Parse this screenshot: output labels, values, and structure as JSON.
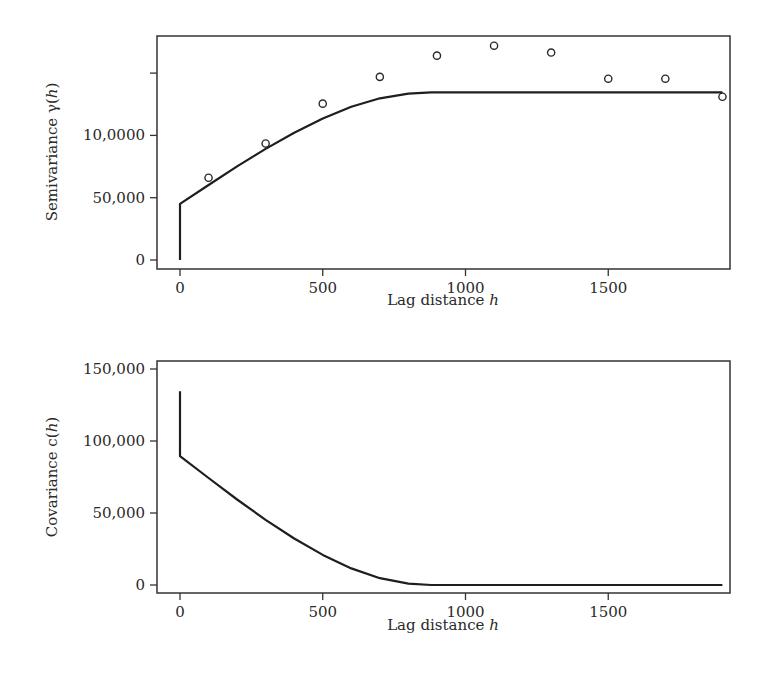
{
  "chart_data": [
    {
      "type": "scatter+line",
      "title": "",
      "xlabel": "Lag distance h",
      "ylabel": "Semivariance γ(h)",
      "xlim": [
        -75,
        1950
      ],
      "ylim": [
        -6000,
        180000
      ],
      "x_ticks": [
        0,
        500,
        1000,
        1500
      ],
      "x_tick_labels": [
        "0",
        "500",
        "1000",
        "1500"
      ],
      "y_ticks": [
        0,
        50000,
        100000,
        150000
      ],
      "y_tick_labels": [
        "0",
        "50,000",
        "10,0000",
        ""
      ],
      "grid": false,
      "legend": null,
      "series": [
        {
          "name": "Empirical semivariogram",
          "style": "open-circles",
          "x": [
            100,
            300,
            500,
            700,
            900,
            1100,
            1300,
            1500,
            1700,
            1900
          ],
          "y": [
            66000,
            93500,
            125500,
            147000,
            164000,
            172000,
            166500,
            145500,
            145500,
            131000
          ]
        },
        {
          "name": "Fitted spherical model",
          "style": "solid-line",
          "nugget": 45000,
          "sill": 134500,
          "range": 880,
          "x": [
            0,
            0,
            100,
            200,
            300,
            400,
            500,
            600,
            700,
            800,
            880,
            1000,
            1500,
            1900
          ],
          "y": [
            0,
            45000,
            60200,
            75100,
            89200,
            102200,
            113600,
            123000,
            129800,
            133500,
            134500,
            134500,
            134500,
            134500
          ]
        }
      ]
    },
    {
      "type": "line",
      "title": "",
      "xlabel": "Lag distance h",
      "ylabel": "Covariance c(h)",
      "xlim": [
        -75,
        1950
      ],
      "ylim": [
        -3000,
        154000
      ],
      "x_ticks": [
        0,
        500,
        1000,
        1500
      ],
      "x_tick_labels": [
        "0",
        "500",
        "1000",
        "1500"
      ],
      "y_ticks": [
        0,
        50000,
        100000,
        150000
      ],
      "y_tick_labels": [
        "0",
        "50,000",
        "100,000",
        "150,000"
      ],
      "grid": false,
      "legend": null,
      "series": [
        {
          "name": "Covariance function",
          "style": "solid-line",
          "x": [
            0,
            0,
            100,
            200,
            300,
            400,
            500,
            600,
            700,
            800,
            880,
            1000,
            1500,
            1900
          ],
          "y": [
            134500,
            89500,
            74300,
            59400,
            45300,
            32300,
            20900,
            11500,
            4700,
            1000,
            0,
            0,
            0,
            0
          ]
        }
      ]
    }
  ],
  "plots": {
    "top": {
      "ylabel_prefix": "Semivariance ",
      "ylabel_symbol": "γ(",
      "ylabel_var": "h",
      "ylabel_close": ")",
      "xlabel_prefix": "Lag distance ",
      "xlabel_var": "h"
    },
    "bottom": {
      "ylabel_prefix": "Covariance ",
      "ylabel_symbol": "c(",
      "ylabel_var": "h",
      "ylabel_close": ")",
      "xlabel_prefix": "Lag distance ",
      "xlabel_var": "h"
    }
  }
}
